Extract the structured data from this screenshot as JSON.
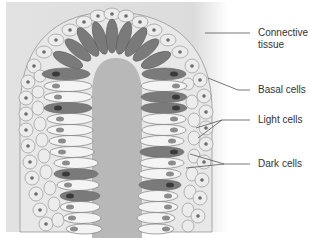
{
  "figure": {
    "type": "histology-illustration",
    "colors": {
      "background": "#ffffff",
      "connective_tissue": "#dedede",
      "lumen": "#b8b8b8",
      "basal_cell_fill": "#e6e6e6",
      "basal_cell_outline": "#8a8a8a",
      "light_cell_fill": "#f4f4f4",
      "dark_cell_fill": "#7a7a7a",
      "nucleus_light": "#8c8c8c",
      "nucleus_dark": "#3a3a3a",
      "leader_line": "#555555",
      "label_text": "#333333"
    }
  },
  "labels": [
    {
      "id": "connective-tissue",
      "lines": [
        "Connective",
        "tissue"
      ]
    },
    {
      "id": "basal-cells",
      "lines": [
        "Basal cells"
      ]
    },
    {
      "id": "light-cells",
      "lines": [
        "Light cells"
      ]
    },
    {
      "id": "dark-cells",
      "lines": [
        "Dark cells"
      ]
    }
  ]
}
